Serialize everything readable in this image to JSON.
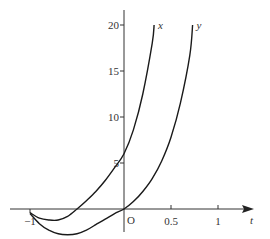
{
  "chart_data": {
    "type": "line",
    "title": "",
    "xlabel": "t",
    "ylabel": "",
    "origin_label": "O",
    "xlim": [
      -1.12,
      1.36
    ],
    "ylim": [
      -2.5,
      21.5
    ],
    "x_ticks": [
      {
        "value": -1,
        "label": "−1"
      },
      {
        "value": 0.5,
        "label": "0.5"
      },
      {
        "value": 1,
        "label": "1"
      }
    ],
    "y_ticks": [
      {
        "value": 5,
        "label": "5"
      },
      {
        "value": 10,
        "label": "10"
      },
      {
        "value": 15,
        "label": "15"
      },
      {
        "value": 20,
        "label": "20"
      }
    ],
    "grid": false,
    "legend": "inline labels at curve ends",
    "series": [
      {
        "name": "x",
        "points": [
          [
            -1.0,
            -0.4
          ],
          [
            -0.9,
            -1.0
          ],
          [
            -0.8,
            -1.2
          ],
          [
            -0.7,
            -1.2
          ],
          [
            -0.6,
            -0.8
          ],
          [
            -0.5,
            0.0
          ],
          [
            -0.4,
            0.9
          ],
          [
            -0.3,
            1.9
          ],
          [
            -0.2,
            3.1
          ],
          [
            -0.1,
            4.5
          ],
          [
            0.0,
            6.0
          ],
          [
            0.1,
            8.6
          ],
          [
            0.2,
            12.5
          ],
          [
            0.3,
            18.0
          ],
          [
            0.32,
            20.0
          ]
        ]
      },
      {
        "name": "y",
        "points": [
          [
            -1.0,
            -0.5
          ],
          [
            -0.9,
            -1.6
          ],
          [
            -0.8,
            -2.3
          ],
          [
            -0.7,
            -2.7
          ],
          [
            -0.6,
            -2.8
          ],
          [
            -0.5,
            -2.7
          ],
          [
            -0.4,
            -2.3
          ],
          [
            -0.3,
            -1.7
          ],
          [
            -0.2,
            -1.1
          ],
          [
            -0.1,
            -0.5
          ],
          [
            0.0,
            0.0
          ],
          [
            0.1,
            0.8
          ],
          [
            0.2,
            1.9
          ],
          [
            0.3,
            3.3
          ],
          [
            0.4,
            5.2
          ],
          [
            0.5,
            7.8
          ],
          [
            0.6,
            11.5
          ],
          [
            0.7,
            16.7
          ],
          [
            0.73,
            20.0
          ]
        ]
      }
    ]
  }
}
